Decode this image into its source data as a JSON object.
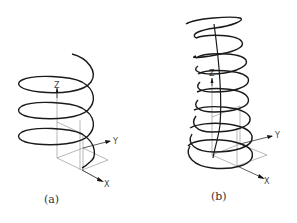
{
  "figures": [
    {
      "id": "a",
      "caption": "(a)",
      "description": "Cylindrical helix with constant radius, 3.5 turns",
      "axes": {
        "x": "X",
        "y": "Y",
        "z": "Z"
      }
    },
    {
      "id": "b",
      "caption": "(b)",
      "description": "Helix along a curved path with decreasing radius, ~8 turns",
      "axes": {
        "x": "X",
        "y": "Y",
        "z": "Z"
      }
    }
  ],
  "colors": {
    "curve": "#222222",
    "axes": "#777777",
    "background": "#ffffff"
  }
}
